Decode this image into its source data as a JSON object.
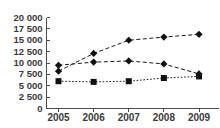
{
  "chart_data": {
    "type": "line",
    "title": "",
    "subtitle": "",
    "xlabel": "",
    "ylabel": "",
    "categories": [
      "2005",
      "2006",
      "2007",
      "2008",
      "2009"
    ],
    "x": [
      2005,
      2006,
      2007,
      2008,
      2009
    ],
    "ylim": [
      0,
      20000
    ],
    "y_ticks": [
      0,
      2500,
      5000,
      7500,
      10000,
      12500,
      15000,
      17500,
      20000
    ],
    "y_tick_labels": [
      "0",
      "2 500",
      "5 000",
      "7 500",
      "10 000",
      "12 500",
      "15 000",
      "17 500",
      "20 000"
    ],
    "x_tick_labels": [
      "2005",
      "2006",
      "2007",
      "2008",
      "2009"
    ],
    "grid": false,
    "legend": "none",
    "series": [
      {
        "name": "series-1-rising",
        "marker": "diamond",
        "line_style": "dashed",
        "color": "#111111",
        "values": [
          8200,
          12100,
          15000,
          15700,
          16300
        ]
      },
      {
        "name": "series-2-plateau",
        "marker": "diamond",
        "line_style": "dashed",
        "color": "#111111",
        "values": [
          9500,
          10200,
          10450,
          9800,
          7600
        ]
      },
      {
        "name": "series-3-flat",
        "marker": "square",
        "line_style": "dotted",
        "color": "#111111",
        "values": [
          6000,
          5850,
          6000,
          6700,
          7050
        ]
      }
    ]
  }
}
